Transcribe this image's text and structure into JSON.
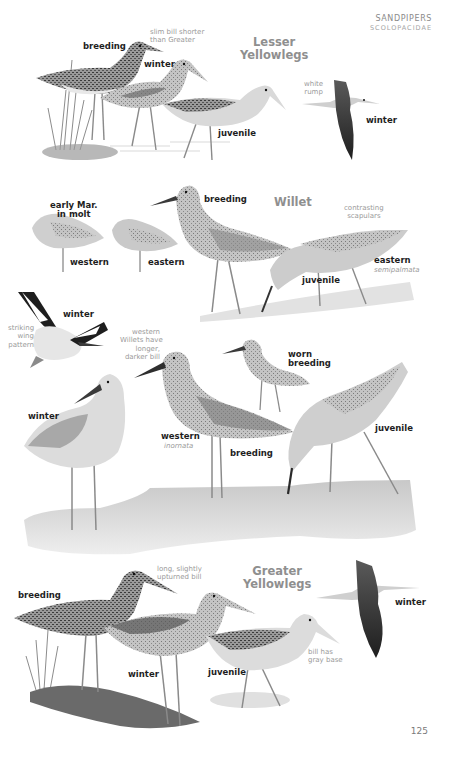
{
  "header": {
    "family": "SANDPIPERS",
    "scientific_family": "SCOLOPACIDAE"
  },
  "page_number": "125",
  "species": [
    {
      "name_line1": "Lesser",
      "name_line2": "Yellowlegs",
      "labels": {
        "breeding": "breeding",
        "winter": "winter",
        "juvenile": "juvenile",
        "flight_winter": "winter"
      },
      "notes": {
        "bill_line1": "slim bill shorter",
        "bill_line2": "than Greater",
        "rump_line1": "white",
        "rump_line2": "rump"
      }
    },
    {
      "name": "Willet",
      "labels": {
        "early_line1": "early Mar.",
        "early_line2": "in molt",
        "western_resting": "western",
        "eastern_resting": "eastern",
        "breeding_top": "breeding",
        "juvenile_top": "juvenile",
        "eastern": "eastern",
        "flight_winter": "winter",
        "winter": "winter",
        "western": "western",
        "breeding_lower": "breeding",
        "worn_line1": "worn",
        "worn_line2": "breeding",
        "juvenile_lower": "juvenile"
      },
      "notes": {
        "scap_line1": "contrasting",
        "scap_line2": "scapulars",
        "eastern_sci": "semipalmata",
        "wing_line1": "striking",
        "wing_line2": "wing",
        "wing_line3": "pattern",
        "bill_line1": "western",
        "bill_line2": "Willets have",
        "bill_line3": "longer,",
        "bill_line4": "darker bill",
        "western_sci": "inornata"
      }
    },
    {
      "name_line1": "Greater",
      "name_line2": "Yellowlegs",
      "labels": {
        "breeding": "breeding",
        "winter": "winter",
        "juvenile": "juvenile",
        "flight_winter": "winter"
      },
      "notes": {
        "bill_line1": "long, slightly",
        "bill_line2": "upturned bill",
        "base_line1": "bill has",
        "base_line2": "gray base"
      }
    }
  ],
  "colors": {
    "ink": "#1e1e1e",
    "title_gray": "#8f8f8f",
    "note_gray": "#9a9a9a",
    "bird_dark": "#4a4a4a",
    "bird_mid": "#8a8a8a",
    "bird_light": "#c9c9c9",
    "ground": "#d6d6d6"
  }
}
